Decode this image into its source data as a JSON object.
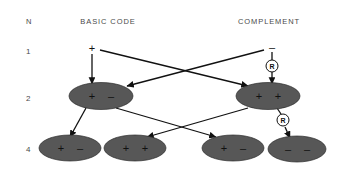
{
  "figure": {
    "title_row": {
      "n_label": "N",
      "basic_code_label": "BASIC CODE",
      "complement_label": "COMPLEMENT"
    },
    "generation_labels": [
      "1",
      "2",
      "4"
    ],
    "colors": {
      "ellipse_fill": "#575757",
      "ellipse_stroke": "#2b2b2b",
      "line": "#111111",
      "header_text": "#4a4a4a",
      "background": "#ffffff",
      "r_circle_fill": "#ffffff"
    },
    "generation_1": {
      "basic_code_symbol": "+",
      "complement_symbol": "–"
    },
    "generation_2": {
      "basic_code_node": {
        "left_sign": "+",
        "right_sign": "–"
      },
      "complement_node": {
        "left_sign": "+",
        "right_sign": "+"
      }
    },
    "generation_4": {
      "nodes": [
        {
          "left_sign": "+",
          "right_sign": "–"
        },
        {
          "left_sign": "+",
          "right_sign": "+"
        },
        {
          "left_sign": "+",
          "right_sign": "–"
        },
        {
          "left_sign": "–",
          "right_sign": "–"
        }
      ]
    },
    "annotations": {
      "r_marker_upper": "R",
      "r_marker_lower": "R"
    }
  }
}
